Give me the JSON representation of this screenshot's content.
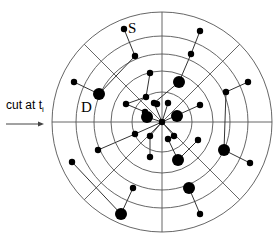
{
  "diagram": {
    "center": [
      162,
      122
    ],
    "ring_radii": [
      30,
      51,
      68,
      86,
      110
    ],
    "spoke_angles_deg": [
      0,
      45,
      90,
      135,
      180,
      225,
      270,
      315
    ],
    "labels": {
      "source": "S",
      "destination": "D",
      "cut_prefix": "cut at t",
      "cut_subscript": "i"
    },
    "nodes": [
      {
        "id": "S",
        "x": 124,
        "y": 29,
        "r": 3.2
      },
      {
        "id": "n1",
        "x": 135,
        "y": 56,
        "r": 3.2
      },
      {
        "id": "D",
        "x": 99,
        "y": 94,
        "r": 6
      },
      {
        "id": "n2",
        "x": 74,
        "y": 82,
        "r": 3.2
      },
      {
        "id": "n3",
        "x": 126,
        "y": 104,
        "r": 3.2
      },
      {
        "id": "n4",
        "x": 146,
        "y": 97,
        "r": 3.2
      },
      {
        "id": "n5",
        "x": 145,
        "y": 112,
        "r": 3.2
      },
      {
        "id": "n6",
        "x": 157,
        "y": 104,
        "r": 3.2
      },
      {
        "id": "n7",
        "x": 150,
        "y": 73,
        "r": 3.2
      },
      {
        "id": "center",
        "x": 162,
        "y": 122,
        "r": 3.2
      },
      {
        "id": "n8",
        "x": 200,
        "y": 31,
        "r": 3.2
      },
      {
        "id": "n9",
        "x": 191,
        "y": 54,
        "r": 3.2
      },
      {
        "id": "n10",
        "x": 179,
        "y": 82,
        "r": 6
      },
      {
        "id": "n11",
        "x": 154,
        "y": 103,
        "r": 3.2
      },
      {
        "id": "n12",
        "x": 168,
        "y": 103,
        "r": 3.2
      },
      {
        "id": "n13",
        "x": 177,
        "y": 116,
        "r": 6
      },
      {
        "id": "n14",
        "x": 200,
        "y": 105,
        "r": 3.2
      },
      {
        "id": "n15",
        "x": 226,
        "y": 92,
        "r": 3.2
      },
      {
        "id": "n16",
        "x": 248,
        "y": 82,
        "r": 3.2
      },
      {
        "id": "n17",
        "x": 147,
        "y": 117,
        "r": 6
      },
      {
        "id": "n18",
        "x": 135,
        "y": 134,
        "r": 3.2
      },
      {
        "id": "n19",
        "x": 98,
        "y": 150,
        "r": 3.2
      },
      {
        "id": "n20",
        "x": 72,
        "y": 162,
        "r": 3.2
      },
      {
        "id": "n21",
        "x": 150,
        "y": 136,
        "r": 3.2
      },
      {
        "id": "n22",
        "x": 150,
        "y": 157,
        "r": 3.2
      },
      {
        "id": "n23",
        "x": 174,
        "y": 136,
        "r": 3.2
      },
      {
        "id": "n24",
        "x": 168,
        "y": 139,
        "r": 3.2
      },
      {
        "id": "n25",
        "x": 178,
        "y": 160,
        "r": 6
      },
      {
        "id": "n26",
        "x": 198,
        "y": 140,
        "r": 3.2
      },
      {
        "id": "n27",
        "x": 224,
        "y": 150,
        "r": 6
      },
      {
        "id": "n28",
        "x": 250,
        "y": 163,
        "r": 3.2
      },
      {
        "id": "n29",
        "x": 189,
        "y": 188,
        "r": 6
      },
      {
        "id": "n30",
        "x": 200,
        "y": 214,
        "r": 3.2
      },
      {
        "id": "n31",
        "x": 133,
        "y": 188,
        "r": 3.2
      },
      {
        "id": "n32",
        "x": 121,
        "y": 214,
        "r": 6
      }
    ],
    "edges": [
      [
        "S",
        "n1"
      ],
      [
        "n1",
        "D"
      ],
      [
        "D",
        "n2"
      ],
      [
        "n3",
        "n4"
      ],
      [
        "n3",
        "n5"
      ],
      [
        "n7",
        "n4"
      ],
      [
        "n8",
        "n9"
      ],
      [
        "n9",
        "n10"
      ],
      [
        "n10",
        "n11"
      ],
      [
        "n12",
        "center"
      ],
      [
        "n11",
        "center"
      ],
      [
        "n14",
        "center"
      ],
      [
        "n15",
        "n16"
      ],
      [
        "n15",
        "n27"
      ],
      [
        "n17",
        "center"
      ],
      [
        "n18",
        "n19"
      ],
      [
        "n18",
        "center"
      ],
      [
        "n20",
        "n32"
      ],
      [
        "n31",
        "n32"
      ],
      [
        "n21",
        "n22"
      ],
      [
        "n21",
        "center"
      ],
      [
        "n23",
        "n24"
      ],
      [
        "n24",
        "n25"
      ],
      [
        "n25",
        "n26"
      ],
      [
        "n23",
        "center"
      ],
      [
        "n27",
        "n28"
      ],
      [
        "n29",
        "n30"
      ]
    ]
  }
}
